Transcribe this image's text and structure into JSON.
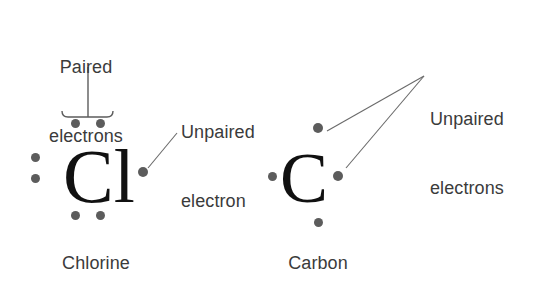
{
  "diagram": {
    "title_text_absent": true,
    "background_color": "#ffffff",
    "electron_color": "#5c5c5c",
    "text_color": "#3b3b3b",
    "symbol_color": "#111111",
    "line_color": "#6a6a6a"
  },
  "annotations": {
    "paired_line1": "Paired",
    "paired_line2": "electrons",
    "unpaired_singular_line1": "Unpaired",
    "unpaired_singular_line2": "electron",
    "unpaired_plural_line1": "Unpaired",
    "unpaired_plural_line2": "electrons"
  },
  "atoms": [
    {
      "symbol": "Cl",
      "name": "Chlorine",
      "electron_count": 7,
      "electrons": [
        {
          "position": "top-left",
          "x": 75,
          "y": 123,
          "paired": true
        },
        {
          "position": "top-right",
          "x": 100,
          "y": 123,
          "paired": true
        },
        {
          "position": "left-upper",
          "x": 35,
          "y": 157,
          "paired": true
        },
        {
          "position": "left-lower",
          "x": 35,
          "y": 178,
          "paired": true
        },
        {
          "position": "right",
          "x": 143,
          "y": 172,
          "paired": false
        },
        {
          "position": "bottom-left",
          "x": 75,
          "y": 215,
          "paired": true
        },
        {
          "position": "bottom-right",
          "x": 100,
          "y": 215,
          "paired": true
        }
      ]
    },
    {
      "symbol": "C",
      "name": "Carbon",
      "electron_count": 4,
      "electrons": [
        {
          "position": "top",
          "x": 318,
          "y": 128,
          "paired": false
        },
        {
          "position": "left",
          "x": 272,
          "y": 176,
          "paired": false
        },
        {
          "position": "right",
          "x": 338,
          "y": 176,
          "paired": false
        },
        {
          "position": "bottom",
          "x": 318,
          "y": 222,
          "paired": false
        }
      ]
    }
  ]
}
